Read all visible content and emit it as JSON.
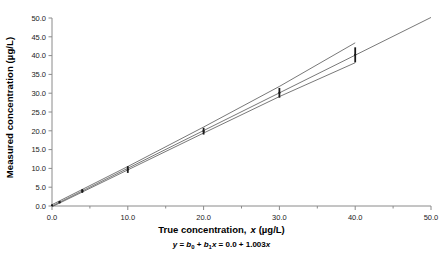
{
  "chart_data": {
    "type": "scatter",
    "title": "",
    "xlabel": "True concentration, x (µg/L)",
    "ylabel": "Measured concentration (µg/L)",
    "xlim": [
      0.0,
      50.0
    ],
    "ylim": [
      0.0,
      50.0
    ],
    "xticks": [
      "0.0",
      "10.0",
      "20.0",
      "30.0",
      "40.0",
      "50.0"
    ],
    "xtick_values": [
      0,
      10,
      20,
      30,
      40,
      50
    ],
    "xminor_values": [
      5,
      15,
      25,
      35,
      45
    ],
    "yticks": [
      "0.0",
      "5.0",
      "10.0",
      "15.0",
      "20.0",
      "25.0",
      "30.0",
      "35.0",
      "40.0",
      "45.0",
      "50.0"
    ],
    "ytick_values": [
      0,
      5,
      10,
      15,
      20,
      25,
      30,
      35,
      40,
      45,
      50
    ],
    "grid": false,
    "legend": "none",
    "equation": "y = b0 + b1x = 0.0 + 1.003x",
    "equation_parts": {
      "y": "y",
      "eq1": " = ",
      "b0": "b",
      "b0sub": "0",
      "plus1": " + ",
      "b1": "b",
      "b1sub": "1",
      "x1": "x",
      "eq2": " = ",
      "intercept": "0.0",
      "plus2": " + ",
      "slope": "1.003",
      "x2": "x"
    },
    "series": [
      {
        "name": "Measured concentration",
        "marker": "error-bar-point",
        "color": "#1a1a1a",
        "x": [
          0.0,
          1.0,
          4.0,
          10.0,
          20.0,
          30.0,
          40.0
        ],
        "y": [
          0.2,
          1.0,
          4.0,
          9.7,
          19.9,
          30.1,
          40.2
        ],
        "yerr_low": [
          0.15,
          0.3,
          0.5,
          0.9,
          0.9,
          1.3,
          2.0
        ],
        "yerr_high": [
          0.15,
          0.3,
          0.5,
          0.9,
          0.9,
          1.3,
          2.0
        ]
      },
      {
        "name": "Regression line",
        "marker": "line",
        "color": "#555555",
        "x": [
          0.0,
          50.0
        ],
        "y": [
          0.0,
          50.15
        ]
      },
      {
        "name": "Upper confidence band",
        "marker": "line",
        "color": "#555555",
        "x": [
          0.0,
          10.0,
          20.0,
          30.0,
          40.0
        ],
        "y": [
          0.35,
          10.5,
          21.0,
          31.8,
          43.4
        ]
      },
      {
        "name": "Lower confidence band",
        "marker": "line",
        "color": "#555555",
        "x": [
          0.0,
          10.0,
          20.0,
          30.0,
          40.0
        ],
        "y": [
          -0.2,
          9.6,
          19.4,
          29.1,
          38.1
        ]
      }
    ]
  },
  "axes": {
    "y_title": "Measured concentration (µg/L)",
    "x_title_main": "True concentration,",
    "x_title_var": "x",
    "x_title_unit": "(µg/L)"
  }
}
